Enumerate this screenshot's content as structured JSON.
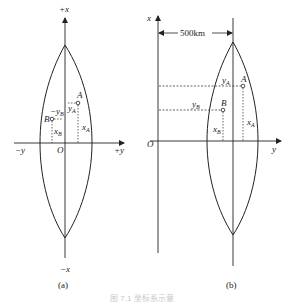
{
  "figure_a": {
    "axis_pos_x": "+x",
    "axis_neg_x": "−x",
    "axis_pos_y": "+y",
    "axis_neg_y": "−y",
    "origin": "O",
    "point_a": "A",
    "point_b": "B",
    "label_ya": "y",
    "label_ya_sub": "A",
    "label_yb": "−y",
    "label_yb_sub": "B",
    "label_xa": "x",
    "label_xa_sub": "A",
    "label_xb": "x",
    "label_xb_sub": "B",
    "caption": "(a)"
  },
  "figure_b": {
    "axis_x": "x",
    "axis_y": "y",
    "origin": "O",
    "distance_label": "500km",
    "point_a": "A",
    "point_b": "B",
    "label_ya": "y",
    "label_ya_sub": "A",
    "label_yb": "y",
    "label_yb_sub": "B",
    "label_xa": "x",
    "label_xa_sub": "A",
    "label_xb": "x",
    "label_xb_sub": "B",
    "caption": "(b)"
  },
  "figure_caption": "图 7.1 坐标系示意"
}
